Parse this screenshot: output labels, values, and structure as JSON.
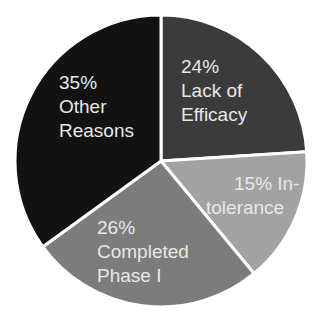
{
  "chart_data": {
    "type": "pie",
    "title": "",
    "start_angle_deg": 0,
    "direction": "clockwise",
    "slices": [
      {
        "label": "Lack of Efficacy",
        "value": 24,
        "display": [
          "24%",
          "Lack of",
          "Efficacy"
        ],
        "color": "#3b3b3b"
      },
      {
        "label": "Intolerance",
        "value": 15,
        "display": [
          "15% In-",
          "tolerance"
        ],
        "color": "#a2a2a2"
      },
      {
        "label": "Completed Phase I",
        "value": 26,
        "display": [
          "26%",
          "Completed",
          "Phase I"
        ],
        "color": "#7c7c7c"
      },
      {
        "label": "Other Reasons",
        "value": 35,
        "display": [
          "35%",
          "Other",
          "Reasons"
        ],
        "color": "#121212"
      }
    ],
    "separator_color": "#ffffff",
    "label_color": "#e8e8e8",
    "legend": "none"
  }
}
